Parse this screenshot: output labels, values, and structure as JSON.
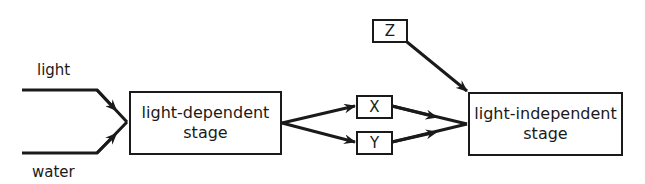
{
  "diagram": {
    "type": "flow",
    "inputs": {
      "light": "light",
      "water": "water"
    },
    "nodes": {
      "light_dependent": {
        "line1": "light-dependent",
        "line2": "stage"
      },
      "x": "X",
      "y": "Y",
      "z": "Z",
      "light_independent": {
        "line1": "light-independent",
        "line2": "stage"
      }
    },
    "edges": [
      {
        "from": "light",
        "to": "light-dependent stage"
      },
      {
        "from": "water",
        "to": "light-dependent stage"
      },
      {
        "from": "light-dependent stage",
        "to": "X"
      },
      {
        "from": "light-dependent stage",
        "to": "Y"
      },
      {
        "from": "X",
        "to": "light-independent stage"
      },
      {
        "from": "Y",
        "to": "light-independent stage"
      },
      {
        "from": "Z",
        "to": "light-independent stage"
      }
    ],
    "colors": {
      "stroke": "#1a1a1a",
      "background": "#ffffff"
    }
  }
}
